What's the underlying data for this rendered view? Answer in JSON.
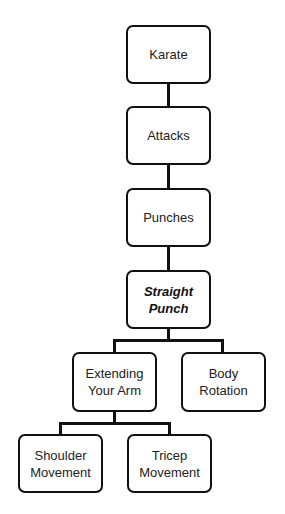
{
  "diagram": {
    "type": "tree",
    "nodes": {
      "karate": "Karate",
      "attacks": "Attacks",
      "punches": "Punches",
      "straight_punch": "Straight Punch",
      "extending_arm": "Extending Your Arm",
      "body_rotation": "Body Rotation",
      "shoulder_movement": "Shoulder Movement",
      "tricep_movement": "Tricep Movement"
    },
    "edges": [
      [
        "Karate",
        "Attacks"
      ],
      [
        "Attacks",
        "Punches"
      ],
      [
        "Punches",
        "Straight Punch"
      ],
      [
        "Straight Punch",
        "Extending Your Arm"
      ],
      [
        "Straight Punch",
        "Body Rotation"
      ],
      [
        "Extending Your Arm",
        "Shoulder Movement"
      ],
      [
        "Extending Your Arm",
        "Tricep Movement"
      ]
    ],
    "highlighted": "Straight Punch"
  }
}
